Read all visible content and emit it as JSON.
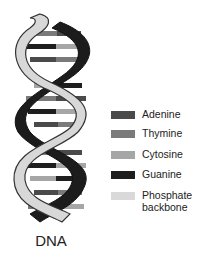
{
  "diagram": {
    "title": "DNA",
    "legend": [
      {
        "label": "Adenine",
        "color": "#4a4a4a"
      },
      {
        "label": "Thymine",
        "color": "#7a7a7a"
      },
      {
        "label": "Cytosine",
        "color": "#a6a6a6"
      },
      {
        "label": "Guanine",
        "color": "#1e1e1e"
      },
      {
        "label": "Phosphate",
        "label2": "backbone",
        "color": "#d9d9d9"
      }
    ],
    "strand_colors": {
      "dark": "#1c1c1c",
      "light": "#d8d8d8",
      "outline": "#333333"
    }
  }
}
